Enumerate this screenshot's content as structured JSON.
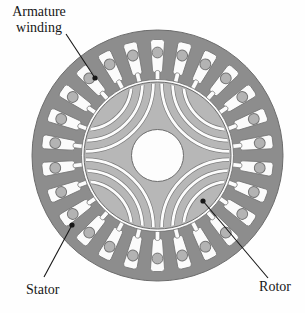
{
  "figure": {
    "type": "electric-machine-cross-section",
    "labels": {
      "armature_winding": "Armature winding",
      "stator": "Stator",
      "rotor": "Rotor"
    },
    "machine": {
      "stator_slots": 26,
      "rotor_poles": 4,
      "flux_barriers_per_pole": 3,
      "components": [
        "stator",
        "rotor",
        "armature winding",
        "shaft bore",
        "flux barriers"
      ]
    },
    "geometry": {
      "center": {
        "x": 157.5,
        "y": 155.5
      },
      "stator_outer_radius": 125.5,
      "stator_bore_radius": 76,
      "rotor_radius": 73.5,
      "shaft_radius": 26,
      "slot_body_outer_radius": 116,
      "slot_body_inner_radius": 83,
      "slot_outer_width": 14,
      "slot_inner_width": 10,
      "slot_neck_width": 4.6,
      "slot_neck_tip_radius": 74,
      "conductor_radius": 5.4,
      "conductor_center_radius": 103,
      "barrier_center_distance": 102,
      "barrier_radii": [
        68,
        57,
        46
      ],
      "barrier_stroke": 2.8,
      "pole_angles_deg": [
        45,
        135,
        225,
        315
      ],
      "leader_dot_radius": 2.6
    },
    "colors": {
      "background": "#fefefe",
      "stator_iron": "#8d8d8d",
      "rotor_iron": "#b7b7b7",
      "slot_fill": "#fbfbfb",
      "slot_stroke": "#747474",
      "conductor_fill": "#b3b3b3",
      "conductor_stroke": "#757575",
      "airgap": "#fcfcfc",
      "shaft_fill": "#fdfdfd",
      "outline": "#6c6c6c",
      "barrier_fill": "#fcfcfc",
      "barrier_edge": "#7e7e7e",
      "label_text": "#171717"
    },
    "leaders": [
      {
        "label": "armature-winding",
        "x1": 66,
        "y1": 34,
        "x2": 95,
        "y2": 78
      },
      {
        "label": "stator",
        "x1": 44,
        "y1": 277,
        "x2": 72,
        "y2": 225
      },
      {
        "label": "rotor",
        "x1": 268,
        "y1": 278,
        "x2": 203,
        "y2": 201
      }
    ]
  }
}
